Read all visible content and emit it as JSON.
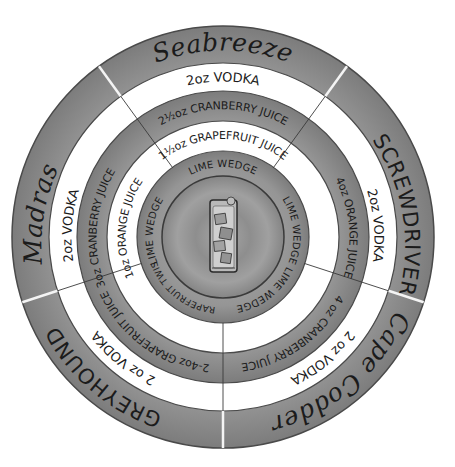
{
  "colors": {
    "grey_ring": "#8a8a8a",
    "grey_ring_light": "#a6a6a6",
    "white_ring": "#ffffff",
    "plate": "#9a9a9a",
    "ink": "#1b1b1b"
  },
  "cocktails": [
    {
      "name": "Seabreeze",
      "style": "script",
      "vodka": "2oz VODKA",
      "mixer1": "2½oz CRANBERRY JUICE",
      "mixer2": "1½oz GRAPEFRUIT JUICE",
      "garnish": "LIME WEDGE"
    },
    {
      "name": "SCREWDRIVER",
      "style": "caps",
      "vodka": "2oz VODKA",
      "mixer1": "4oz ORANGE JUICE",
      "mixer2": "",
      "garnish": "LIME WEDGE"
    },
    {
      "name": "Cape Codder",
      "style": "script",
      "vodka": "2 oz VODKA",
      "mixer1": "4 oz CRANBERRY JUICE",
      "mixer2": "",
      "garnish": "LIME WEDGE"
    },
    {
      "name": "GREYHOUND",
      "style": "caps",
      "vodka": "2 oz VODKA",
      "mixer1": "2-4oz GRAPEFRUIT JUICE",
      "mixer2": "",
      "garnish": "GRAPEFRUIT TWIST"
    },
    {
      "name": "Madras",
      "style": "script",
      "vodka": "2oz VODKA",
      "mixer1": "3oz CRANBERRY JUICE",
      "mixer2": "1oz ORANGE JUICE",
      "garnish": "LIME WEDGE"
    }
  ],
  "center": {
    "icon": "highball-glass-icon"
  }
}
